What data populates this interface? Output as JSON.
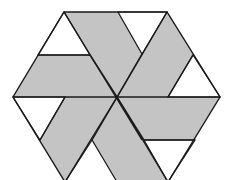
{
  "figure": {
    "colors": {
      "background": "#ffffff",
      "shaded": "#c4c4c4",
      "unshaded": "#ffffff",
      "stroke": "#1a1a1a"
    },
    "hexagon": {
      "center": [
        117,
        97
      ],
      "vertices": [
        [
          64,
          12
        ],
        [
          167,
          12
        ],
        [
          220,
          97
        ],
        [
          168,
          182
        ],
        [
          65,
          182
        ],
        [
          13,
          97
        ]
      ]
    },
    "white_triangles": [
      {
        "name": "upper-left",
        "points": "64,12 38,55 90,55"
      },
      {
        "name": "top",
        "points": "118,12 167,12 142,54"
      },
      {
        "name": "right",
        "points": "193,55 220,97 168,97"
      },
      {
        "name": "lower-right",
        "points": "144,140 195,140 168,182"
      },
      {
        "name": "bottom",
        "points": "92,140 65,182 117,182"
      },
      {
        "name": "left",
        "points": "13,97 65,97 40,140"
      }
    ],
    "shaded_regions_count": 6,
    "unshaded_regions_count": 6
  }
}
